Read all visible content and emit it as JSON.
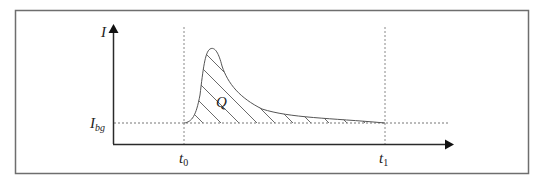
{
  "diagram": {
    "type": "current-pulse-integration",
    "axes": {
      "y_label": "I",
      "x_label": ""
    },
    "labels": {
      "background_current": {
        "main": "I",
        "sub": "bg"
      },
      "start_time": {
        "main": "t",
        "sub": "0"
      },
      "end_time": {
        "main": "t",
        "sub": "1"
      },
      "charge_area": "Q"
    },
    "colors": {
      "frame": "#6e6e6e",
      "axis": "#2a2a2a",
      "curve": "#555555",
      "hatch": "#444444",
      "dotted": "#777777"
    }
  }
}
